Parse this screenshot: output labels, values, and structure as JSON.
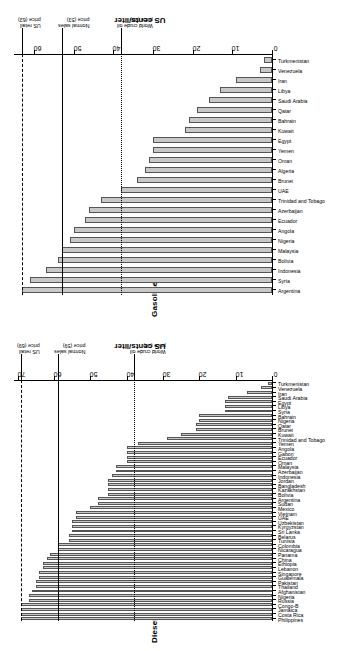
{
  "figure": {
    "orientation": "rotated-90",
    "panels": [
      "Diesel",
      "Gasoline"
    ]
  },
  "chart_data": [
    {
      "type": "bar",
      "title": "Gasoline",
      "xlabel": "",
      "ylabel": "US cents/liter",
      "ylim": [
        0,
        65
      ],
      "yticks": [
        0,
        10,
        20,
        30,
        40,
        50,
        60
      ],
      "grid": false,
      "legend": "none",
      "categories": [
        "Argentina",
        "Syria",
        "Indonesia",
        "Bolivia",
        "Malaysia",
        "Nigeria",
        "Angola",
        "Ecuador",
        "Azerbaijan",
        "Trinidad and Tobago",
        "UAE",
        "Brunei",
        "Algeria",
        "Oman",
        "Yemen",
        "Egypt",
        "Kuwait",
        "Bahrain",
        "Qatar",
        "Saudi Arabia",
        "Libya",
        "Iran",
        "Venezuela",
        "Turkmenistan"
      ],
      "values": [
        63,
        61,
        57,
        54,
        53,
        51,
        50,
        47,
        46,
        43,
        38,
        34,
        32,
        31,
        30,
        30,
        22,
        21,
        19,
        16,
        13,
        9,
        3,
        2
      ],
      "reference_lines": [
        {
          "label": "US retail price (63)",
          "value": 63,
          "style": "dashdot"
        },
        {
          "label": "Normal sales price (53)",
          "value": 53,
          "style": "solid"
        },
        {
          "label": "World crude oil price (38)",
          "value": 38,
          "style": "dotted"
        }
      ]
    },
    {
      "type": "bar",
      "title": "Diesel",
      "xlabel": "",
      "ylabel": "US cents/liter",
      "ylim": [
        0,
        71
      ],
      "yticks": [
        0,
        10,
        20,
        30,
        40,
        50,
        60,
        70
      ],
      "grid": false,
      "legend": "none",
      "categories": [
        "Philippines",
        "Costa Rica",
        "Jamaica",
        "Congo-B",
        "Russia",
        "Nigeria",
        "Afghanistan",
        "Thailand",
        "Pakistan",
        "Guatemala",
        "Singapore",
        "Lebanon",
        "Ethiopia",
        "China",
        "Panama",
        "Nicaragua",
        "Colombia",
        "Tunisia",
        "Belarus",
        "Sri Lanka",
        "Kyrgyzstan",
        "Uzbekistan",
        "UAE",
        "Vietnam",
        "Mexico",
        "Sudan",
        "Argentina",
        "Bolivia",
        "Kazakhstan",
        "Bangladesh",
        "Jordan",
        "Indonesia",
        "Azerbaijan",
        "Malaysia",
        "Oman",
        "Ecuador",
        "Gabon",
        "Angola",
        "Yemen",
        "Trinidad and Tobago",
        "Kuwait",
        "Brunei",
        "Qatar",
        "Nigeria",
        "Bahrain",
        "Syria",
        "Libya",
        "Egypt",
        "Saudi Arabia",
        "Iran",
        "Venezuela",
        "Turkmenistan"
      ],
      "values": [
        69,
        69,
        69,
        69,
        67,
        67,
        66,
        65,
        65,
        64,
        64,
        63,
        63,
        62,
        61,
        59,
        59,
        56,
        56,
        55,
        55,
        55,
        54,
        54,
        50,
        48,
        48,
        45,
        45,
        45,
        45,
        44,
        43,
        43,
        40,
        40,
        40,
        40,
        37,
        29,
        25,
        21,
        21,
        20,
        20,
        13,
        13,
        13,
        12,
        7,
        3,
        1
      ],
      "reference_lines": [
        {
          "label": "US retail price (69)",
          "value": 69,
          "style": "dashdot"
        },
        {
          "label": "Normal sales price (59)",
          "value": 59,
          "style": "solid"
        },
        {
          "label": "World crude oil price (38)",
          "value": 38,
          "style": "dotted"
        }
      ]
    }
  ],
  "colors": {
    "bar_fill": "#c8c8c8",
    "bar_border": "#555555",
    "axis": "#000000",
    "background": "#ffffff"
  }
}
